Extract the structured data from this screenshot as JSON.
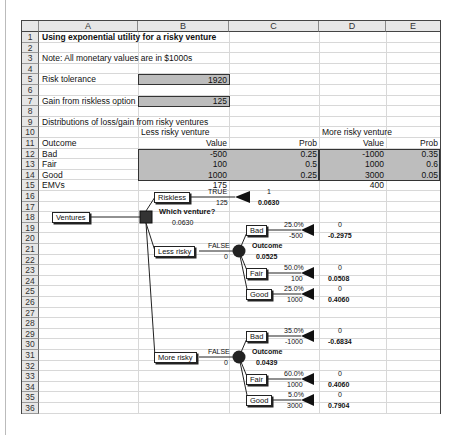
{
  "columns": [
    "A",
    "B",
    "C",
    "D",
    "E"
  ],
  "rows": [
    "1",
    "2",
    "3",
    "4",
    "5",
    "6",
    "7",
    "8",
    "9",
    "10",
    "11",
    "12",
    "13",
    "14",
    "15",
    "16",
    "17",
    "18",
    "19",
    "20",
    "21",
    "22",
    "23",
    "24",
    "25",
    "26",
    "27",
    "28",
    "29",
    "30",
    "31",
    "32",
    "33",
    "34",
    "35",
    "36"
  ],
  "title": "Using exponential utility for a risky venture",
  "note": "Note: All monetary values are in $1000s",
  "risk_tolerance": {
    "label": "Risk tolerance",
    "value": "1920"
  },
  "riskless_gain": {
    "label": "Gain from riskless option",
    "value": "125"
  },
  "distributions": {
    "heading": "Distributions of loss/gain from risky ventures",
    "less_risky_label": "Less risky venture",
    "more_risky_label": "More risky venture",
    "outcome_header": "Outcome",
    "value_header": "Value",
    "prob_header": "Prob",
    "outcomes": [
      {
        "name": "Bad",
        "less_value": "-500",
        "less_prob": "0.25",
        "more_value": "-1000",
        "more_prob": "0.35"
      },
      {
        "name": "Fair",
        "less_value": "100",
        "less_prob": "0.5",
        "more_value": "1000",
        "more_prob": "0.6"
      },
      {
        "name": "Good",
        "less_value": "1000",
        "less_prob": "0.25",
        "more_value": "3000",
        "more_prob": "0.05"
      }
    ],
    "emv_label": "EMVs",
    "less_emv": "175",
    "more_emv": "400"
  },
  "tree": {
    "root_label": "Ventures",
    "decision_label": "Which venture?",
    "decision_value": "0.0630",
    "riskless": {
      "label": "Riskless",
      "flag": "TRUE",
      "value": "125",
      "prob": "1",
      "utility": "0.0630"
    },
    "less_risky": {
      "label": "Less risky",
      "flag": "FALSE",
      "value": "0",
      "chance_label": "Outcome",
      "chance_value": "0.0525",
      "branches": [
        {
          "label": "Bad",
          "pct": "25.0%",
          "value": "-500",
          "prob": "0",
          "utility": "-0.2975"
        },
        {
          "label": "Fair",
          "pct": "50.0%",
          "value": "100",
          "prob": "0",
          "utility": "0.0508"
        },
        {
          "label": "Good",
          "pct": "25.0%",
          "value": "1000",
          "prob": "0",
          "utility": "0.4060"
        }
      ]
    },
    "more_risky": {
      "label": "More risky",
      "flag": "FALSE",
      "value": "0",
      "chance_label": "Outcome",
      "chance_value": "0.0439",
      "branches": [
        {
          "label": "Bad",
          "pct": "35.0%",
          "value": "-1000",
          "prob": "0",
          "utility": "-0.6834"
        },
        {
          "label": "Fair",
          "pct": "60.0%",
          "value": "1000",
          "prob": "0",
          "utility": "0.4060"
        },
        {
          "label": "Good",
          "pct": "5.0%",
          "value": "3000",
          "prob": "0",
          "utility": "0.7904"
        }
      ]
    }
  }
}
